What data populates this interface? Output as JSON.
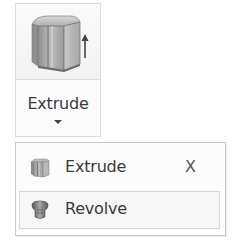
{
  "ribbon_button": {
    "label": "Extrude",
    "icon": "extrude-icon",
    "dropdown_icon": "chevron-down-icon"
  },
  "menu": {
    "items": [
      {
        "label": "Extrude",
        "icon": "extrude-icon",
        "shortcut": "X",
        "highlighted": false
      },
      {
        "label": "Revolve",
        "icon": "revolve-icon",
        "shortcut": "",
        "highlighted": true
      }
    ]
  }
}
